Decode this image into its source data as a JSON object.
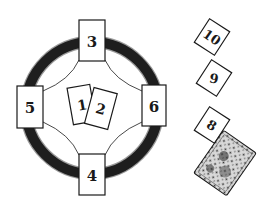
{
  "diagram": {
    "title": "",
    "type": "tarot-spread",
    "colors": {
      "ring": "#1e1e1e",
      "ring_edge": "#9a9a9a",
      "card_border": "#1a1a1a",
      "card_fill": "#ffffff",
      "text": "#1a1a1a"
    },
    "cross_cards": [
      {
        "id": "card-1",
        "label": "1"
      },
      {
        "id": "card-2",
        "label": "2"
      },
      {
        "id": "card-3",
        "label": "3"
      },
      {
        "id": "card-4",
        "label": "4"
      },
      {
        "id": "card-5",
        "label": "5"
      },
      {
        "id": "card-6",
        "label": "6"
      }
    ],
    "staff_cards": [
      {
        "id": "card-8",
        "label": "8"
      },
      {
        "id": "card-9",
        "label": "9"
      },
      {
        "id": "card-10",
        "label": "10"
      }
    ],
    "deck": {
      "label": "deck",
      "face": "down"
    }
  }
}
